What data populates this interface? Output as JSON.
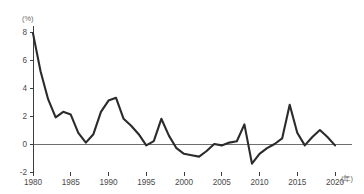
{
  "chart_data": {
    "type": "line",
    "title": "",
    "subtitle": "",
    "xlabel": "",
    "ylabel": "",
    "unit_label": "(%)",
    "x_axis_suffix": "(年)",
    "xlim": [
      1980,
      2020
    ],
    "ylim": [
      -2,
      8
    ],
    "grid": false,
    "legend": null,
    "zero_line": true,
    "y_ticks": [
      8,
      6,
      4,
      2,
      0,
      -2
    ],
    "y_tick_labels": [
      "8",
      "6",
      "4",
      "2",
      "0",
      "-2"
    ],
    "x_ticks": [
      1980,
      1985,
      1990,
      1995,
      2000,
      2005,
      2010,
      2015,
      2020
    ],
    "x_tick_labels": [
      "1980",
      "1985",
      "1990",
      "1995",
      "2000",
      "2005",
      "2010",
      "2015",
      "2020"
    ],
    "series": [
      {
        "name": "growth-rate",
        "color": "#2b2b2b",
        "x": [
          1980,
          1981,
          1982,
          1983,
          1984,
          1985,
          1986,
          1987,
          1988,
          1989,
          1990,
          1991,
          1992,
          1993,
          1994,
          1995,
          1996,
          1997,
          1998,
          1999,
          2000,
          2001,
          2002,
          2003,
          2004,
          2005,
          2006,
          2007,
          2008,
          2009,
          2010,
          2011,
          2012,
          2013,
          2014,
          2015,
          2016,
          2017,
          2018,
          2019,
          2020
        ],
        "values": [
          7.9,
          5.2,
          3.2,
          1.9,
          2.3,
          2.1,
          0.8,
          0.1,
          0.7,
          2.3,
          3.1,
          3.3,
          1.8,
          1.3,
          0.7,
          -0.1,
          0.2,
          1.8,
          0.6,
          -0.3,
          -0.7,
          -0.8,
          -0.9,
          -0.5,
          0.0,
          -0.1,
          0.1,
          0.2,
          1.4,
          -1.4,
          -0.7,
          -0.3,
          0.0,
          0.4,
          2.8,
          0.8,
          -0.1,
          0.5,
          1.0,
          0.5,
          -0.1
        ]
      }
    ]
  },
  "plot": {
    "x_left_px": 33,
    "x_right_px": 335,
    "y_top_value": 8,
    "y_top_px": 32,
    "y_bottom_value": -2,
    "y_bottom_px": 172
  }
}
